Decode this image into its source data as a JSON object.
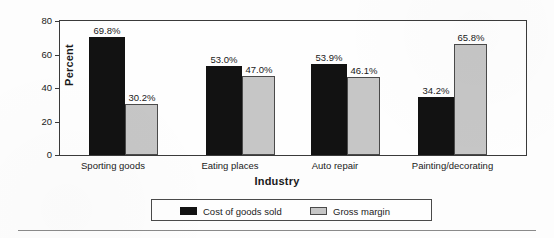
{
  "chart_data": {
    "type": "bar",
    "title": "",
    "subtitle": "",
    "xlabel": "Industry",
    "ylabel": "Percent",
    "categories": [
      "Sporting goods",
      "Eating places",
      "Auto repair",
      "Painting/decorating"
    ],
    "series": [
      {
        "name": "Cost of goods sold",
        "color": "#121212",
        "values": [
          69.8,
          53.0,
          53.9,
          34.2
        ],
        "labels": [
          "69.8%",
          "53.0%",
          "53.9%",
          "34.2%"
        ]
      },
      {
        "name": "Gross margin",
        "color": "#c6c6c6",
        "values": [
          30.2,
          47.0,
          46.1,
          65.8
        ],
        "labels": [
          "30.2%",
          "47.0%",
          "46.1%",
          "65.8%"
        ]
      }
    ],
    "ylim": [
      0,
      80
    ],
    "yticks": [
      0,
      20,
      40,
      60,
      80
    ],
    "ytick_labels": [
      "0",
      "20",
      "40",
      "60",
      "80"
    ],
    "grid": false,
    "legend_position": "bottom",
    "grouped": true
  },
  "axes": {
    "y_title": "Percent",
    "x_title": "Industry",
    "y_tick_labels": [
      "80",
      "60",
      "40",
      "20",
      "0"
    ]
  },
  "legend": {
    "entries": [
      {
        "label": "Cost of goods sold",
        "swatch": "dark-swatch-icon"
      },
      {
        "label": "Gross margin",
        "swatch": "light-swatch-icon"
      }
    ]
  }
}
